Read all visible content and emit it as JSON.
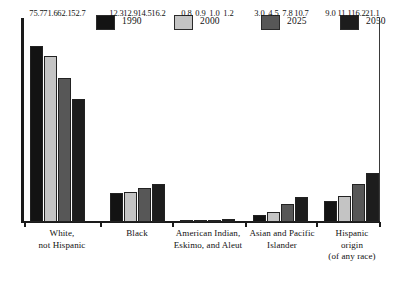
{
  "chart_data": {
    "type": "bar",
    "title": "",
    "subtitle": "",
    "xlabel": "",
    "ylabel": "",
    "ylim": [
      0,
      80
    ],
    "grid": false,
    "legend_position": "top",
    "value_labels": true,
    "categories": [
      "White, not Hispanic",
      "Black",
      "American Indian, Eskimo, and Aleut",
      "Asian and Pacific Islander",
      "Hispanic origin (of any race)"
    ],
    "category_lines": [
      [
        "White,",
        "not Hispanic"
      ],
      [
        "Black"
      ],
      [
        "American Indian,",
        "Eskimo, and Aleut"
      ],
      [
        "Asian and Pacific",
        "Islander"
      ],
      [
        "Hispanic",
        "origin",
        "(of any race)"
      ]
    ],
    "series": [
      {
        "name": "1990",
        "color": "#131313",
        "values": [
          75.7,
          12.3,
          0.8,
          3.0,
          9.0
        ]
      },
      {
        "name": "2000",
        "color": "#c4c4c4",
        "values": [
          71.6,
          12.9,
          0.9,
          4.5,
          11.1
        ]
      },
      {
        "name": "2025",
        "color": "#575757",
        "values": [
          62.1,
          14.5,
          1.0,
          7.8,
          16.2
        ]
      },
      {
        "name": "2050",
        "color": "#1d1d1d",
        "values": [
          52.7,
          16.2,
          1.2,
          10.7,
          21.1
        ]
      }
    ],
    "value_text": {
      "White, not Hispanic": [
        "75.7",
        "71.6",
        "62.1",
        "52.7"
      ],
      "Black": [
        "12.3",
        "12.9",
        "14.5",
        "16.2"
      ],
      "American Indian, Eskimo, and Aleut": [
        "0.8",
        "0.9",
        "1.0",
        "1.2"
      ],
      "Asian and Pacific Islander": [
        "3.0",
        "4.5",
        "7.8",
        "10.7"
      ],
      "Hispanic origin (of any race)": [
        "9.0",
        "11.1",
        "16.2",
        "21.1"
      ]
    }
  },
  "legend": {
    "items": [
      {
        "label": "1990",
        "color": "#131313"
      },
      {
        "label": "2000",
        "color": "#c4c4c4"
      },
      {
        "label": "2025",
        "color": "#575757"
      },
      {
        "label": "2050",
        "color": "#1d1d1d"
      }
    ]
  },
  "axis": {
    "y_spine_color": "#1a1a1a",
    "x_spine_color": "#1a1a1a"
  }
}
